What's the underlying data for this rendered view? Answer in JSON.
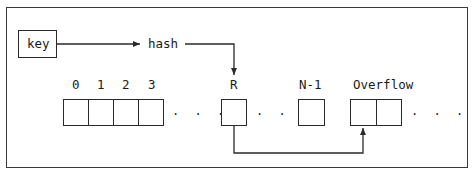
{
  "diagram": {
    "key_box": {
      "label": "key"
    },
    "hash_label": "hash",
    "bucket_indices": [
      "0",
      "1",
      "2",
      "3"
    ],
    "target_bucket_label": "R",
    "last_bucket_label": "N-1",
    "overflow_label": "Overflow",
    "ellipsis": ". . .",
    "edges": [
      {
        "from": "key",
        "to": "hash"
      },
      {
        "from": "hash",
        "to": "R"
      },
      {
        "from": "R",
        "to": "Overflow"
      }
    ],
    "colors": {
      "line": "#2a2a2a",
      "frame": "#3a3a3a",
      "background": "#ffffff"
    }
  }
}
